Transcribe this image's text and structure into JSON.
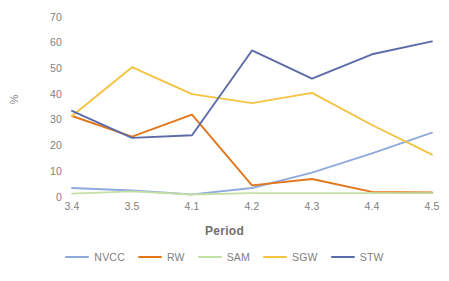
{
  "chart_data": {
    "type": "line",
    "title": "",
    "xlabel": "Period",
    "ylabel": "%",
    "categories": [
      "3.4",
      "3.5",
      "4.1",
      "4.2",
      "4.3",
      "4.4",
      "4.5"
    ],
    "ylim": [
      0,
      70
    ],
    "yticks": [
      0,
      10,
      20,
      30,
      40,
      50,
      60,
      70
    ],
    "ytick_labels": [
      "0",
      "10",
      "20",
      "30",
      "40",
      "50",
      "60",
      "70"
    ],
    "grid": false,
    "legend_position": "bottom",
    "series": [
      {
        "name": "NVCC",
        "color": "#8FAADC",
        "values": [
          3.5,
          2.5,
          1.0,
          3.5,
          9.5,
          17.0,
          25.0
        ]
      },
      {
        "name": "RW",
        "color": "#E2761B",
        "values": [
          31.5,
          23.5,
          32.0,
          4.5,
          7.0,
          2.0,
          1.8
        ]
      },
      {
        "name": "SAM",
        "color": "#C5E0A5",
        "values": [
          1.3,
          2.2,
          1.0,
          1.5,
          1.5,
          1.5,
          1.5
        ]
      },
      {
        "name": "SGW",
        "color": "#F5C242",
        "values": [
          31.5,
          50.5,
          40.0,
          36.5,
          40.5,
          28.0,
          16.5
        ]
      },
      {
        "name": "STW",
        "color": "#5B6BA8",
        "values": [
          33.5,
          23.0,
          24.0,
          57.0,
          46.0,
          55.5,
          60.5
        ]
      }
    ]
  },
  "axis": {
    "y_label": "%",
    "x_label": "Period"
  },
  "colors": {
    "text": "#808080",
    "background": "#ffffff"
  }
}
